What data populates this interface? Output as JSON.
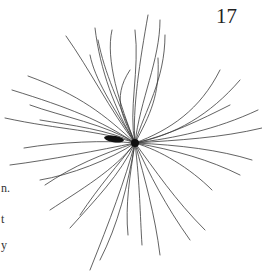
{
  "page": {
    "number": "17",
    "margin_fragments": [
      {
        "text": "n.",
        "top": 181
      },
      {
        "text": "t",
        "top": 212
      },
      {
        "text": "y",
        "top": 238
      }
    ]
  },
  "illustration": {
    "subject": "radiating-fibers-specimen",
    "center": [
      135,
      143
    ],
    "stroke_color": "#1a1a1a"
  }
}
